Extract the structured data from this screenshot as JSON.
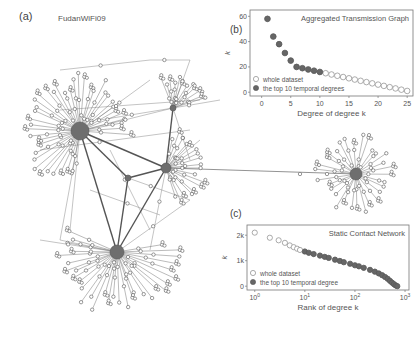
{
  "panels": {
    "a": {
      "label": "(a)",
      "title": "FudanWiFi09"
    },
    "b": {
      "label": "(b)"
    },
    "c": {
      "label": "(c)"
    }
  },
  "chart_data": [
    {
      "type": "scatter",
      "panel": "(b)",
      "title": "Aggregated Transmission Graph",
      "xlabel": "Degree of degree k",
      "ylabel": "k",
      "xlim": [
        -2,
        26
      ],
      "ylim": [
        -3,
        65
      ],
      "xticks": [
        0,
        5,
        10,
        15,
        20,
        25
      ],
      "yticks": [
        0,
        20,
        40,
        60
      ],
      "legend": [
        "whole dataset",
        "the top 10 temporal degrees"
      ],
      "legend_position": "lower left",
      "series": [
        {
          "name": "whole dataset",
          "marker": "open-circle",
          "x": [
            1,
            2,
            3,
            4,
            5,
            6,
            7,
            8,
            9,
            10,
            11,
            12,
            13,
            14,
            15,
            16,
            17,
            18,
            19,
            20,
            21,
            22,
            23,
            24,
            25
          ],
          "y": [
            58,
            44,
            38,
            31,
            25,
            20,
            19,
            18,
            17,
            16,
            15,
            14,
            13,
            12,
            11,
            10,
            9,
            8,
            7,
            6,
            5,
            4,
            3,
            2,
            1
          ]
        },
        {
          "name": "the top 10 temporal degrees",
          "marker": "filled-circle",
          "x": [
            1,
            2,
            3,
            4,
            5,
            6,
            7,
            8,
            9,
            10
          ],
          "y": [
            58,
            44,
            38,
            31,
            25,
            20,
            19,
            18,
            17,
            16
          ]
        }
      ]
    },
    {
      "type": "scatter",
      "panel": "(c)",
      "title": "Static Contact Network",
      "xlabel": "Rank of degree k",
      "ylabel": "k",
      "xscale": "log",
      "xlim": [
        0.7,
        1200
      ],
      "ylim": [
        -150,
        2400
      ],
      "xticks": [
        "10^0",
        "10^1",
        "10^2",
        "10^3"
      ],
      "yticks": [
        "0",
        "1k",
        "2k"
      ],
      "legend": [
        "whole dataset",
        "the top 10 temporal degree"
      ],
      "legend_position": "lower left",
      "series": [
        {
          "name": "whole dataset",
          "marker": "open-circle",
          "x": [
            1,
            2,
            3,
            4,
            5,
            6,
            7,
            8,
            10,
            12,
            15,
            20,
            25,
            30,
            40,
            50,
            60,
            80,
            100,
            120,
            150,
            200,
            250,
            300,
            350,
            400,
            450,
            500,
            550,
            600,
            650,
            700
          ],
          "y": [
            2100,
            1900,
            1800,
            1700,
            1600,
            1530,
            1470,
            1420,
            1360,
            1310,
            1260,
            1200,
            1150,
            1110,
            1040,
            990,
            940,
            880,
            820,
            780,
            720,
            640,
            570,
            500,
            430,
            360,
            290,
            210,
            140,
            80,
            30,
            0
          ]
        },
        {
          "name": "the top 10 temporal degree",
          "marker": "filled-circle",
          "x": [
            10,
            12,
            15,
            20,
            25,
            30,
            40,
            50,
            60,
            80,
            100,
            120,
            150,
            200,
            250,
            300,
            350,
            400,
            450,
            500,
            550,
            600,
            650,
            700
          ],
          "y": [
            1360,
            1310,
            1260,
            1200,
            1150,
            1110,
            1040,
            990,
            940,
            880,
            820,
            780,
            720,
            640,
            570,
            500,
            430,
            360,
            290,
            210,
            140,
            80,
            30,
            0
          ]
        }
      ]
    }
  ],
  "network": {
    "hubs": [
      {
        "id": "H1",
        "x": 80,
        "y": 131,
        "r": 9
      },
      {
        "id": "H2",
        "x": 117,
        "y": 252,
        "r": 7
      },
      {
        "id": "H3",
        "x": 166,
        "y": 168,
        "r": 5
      },
      {
        "id": "H4",
        "x": 356,
        "y": 174,
        "r": 6
      },
      {
        "id": "H5",
        "x": 173,
        "y": 108,
        "r": 3
      },
      {
        "id": "H6",
        "x": 128,
        "y": 178,
        "r": 3
      }
    ],
    "strong_edges": [
      [
        "H1",
        "H6"
      ],
      [
        "H6",
        "H3"
      ],
      [
        "H1",
        "H3"
      ],
      [
        "H6",
        "H2"
      ],
      [
        "H3",
        "H2"
      ],
      [
        "H1",
        "H2"
      ],
      [
        "H3",
        "H5"
      ]
    ],
    "long_edges": [
      [
        "H3",
        "H4"
      ]
    ]
  }
}
